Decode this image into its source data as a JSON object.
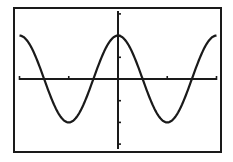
{
  "chart_data": {
    "type": "line",
    "title": "",
    "xlabel": "",
    "ylabel": "",
    "function": "y = 2cos(x)",
    "window": {
      "xmin": -6.2832,
      "xmax": 6.2832,
      "xscl": 3.1416,
      "ymin": -3.3,
      "ymax": 3.3,
      "yscl": 1
    },
    "grid": false,
    "legend": null,
    "series": [
      {
        "name": "Y1",
        "amplitude": 2,
        "period": 6.2832,
        "x": [
          -6.2832,
          -4.7124,
          -3.1416,
          -1.5708,
          0,
          1.5708,
          3.1416,
          4.7124,
          6.2832
        ],
        "y": [
          2,
          0,
          -2,
          0,
          2,
          0,
          -2,
          0,
          2
        ]
      }
    ],
    "x_ticks": [
      -6.2832,
      -3.1416,
      0,
      3.1416,
      6.2832
    ],
    "y_ticks": [
      -3,
      -2,
      -1,
      1,
      2,
      3
    ]
  },
  "colors": {
    "background": "#ffffff",
    "ink": "#1a1a1a"
  }
}
